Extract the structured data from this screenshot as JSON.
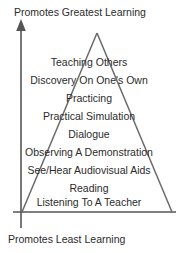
{
  "figure": {
    "background_color": "#ffffff",
    "line_color": "#555555",
    "text_color": "#2b2b2b"
  },
  "axis": {
    "top_label": "Promotes Greatest Learning",
    "bottom_label": "Promotes Least Learning",
    "vertical_arrow_direction": "up",
    "vertical_arrow_icon": "arrow-up-icon",
    "baseline_icon": "horizontal-baseline"
  },
  "pyramid": {
    "rows": [
      {
        "label": "Teaching Others"
      },
      {
        "label": "Discovery On One's Own"
      },
      {
        "label": "Practicing"
      },
      {
        "label": "Practical Simulation"
      },
      {
        "label": "Dialogue"
      },
      {
        "label": "Observing A Demonstration"
      },
      {
        "label": "See/Hear Audiovisual Aids"
      },
      {
        "label": "Reading"
      },
      {
        "label": "Listening To A Teacher"
      }
    ]
  }
}
